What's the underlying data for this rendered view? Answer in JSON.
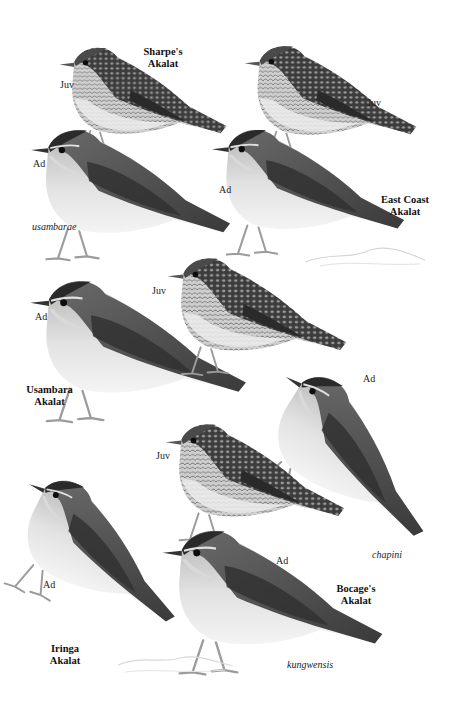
{
  "plate": {
    "species": [
      {
        "id": "sharpes",
        "name_line1": "Sharpe's",
        "name_line2": "Akalat"
      },
      {
        "id": "east-coast",
        "name_line1": "East Coast",
        "name_line2": "Akalat"
      },
      {
        "id": "usambara",
        "name_line1": "Usambara",
        "name_line2": "Akalat"
      },
      {
        "id": "iringa",
        "name_line1": "Iringa",
        "name_line2": "Akalat"
      },
      {
        "id": "bocages",
        "name_line1": "Bocage's",
        "name_line2": "Akalat"
      }
    ],
    "age_labels": {
      "juv": "Juv",
      "ad": "Ad"
    },
    "subspecies": {
      "usambarae": "usambarae",
      "chapini": "chapini",
      "kungwensis": "kungwensis"
    },
    "colors": {
      "background": "#ffffff",
      "upperparts": "#4a4a4a",
      "wing": "#3a3a3a",
      "underparts": "#e6e6e6",
      "breast": "#bdbdbd",
      "legs": "#a8a8a8"
    }
  }
}
